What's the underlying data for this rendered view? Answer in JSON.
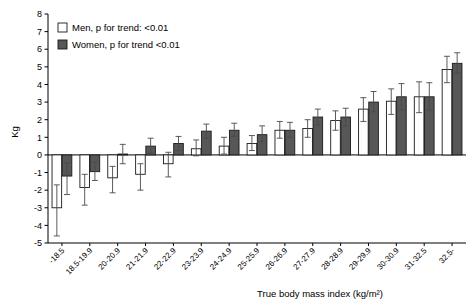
{
  "chart_data": {
    "type": "bar",
    "title": "",
    "xlabel": "True body mass index (kg/m²)",
    "ylabel": "Kg",
    "ylim": [
      -5,
      8
    ],
    "yticks": [
      -5,
      -4,
      -3,
      -2,
      -1,
      0,
      1,
      2,
      3,
      4,
      5,
      6,
      7,
      8
    ],
    "ytick_labels": [
      "-5",
      "-4",
      "-3",
      "-2",
      "-1",
      "0",
      "1",
      "2",
      "3",
      "4",
      "5",
      "6",
      "7",
      "8"
    ],
    "grid": false,
    "legend_position": "top-left",
    "categories": [
      "-18.5",
      "18.5-19.9",
      "20-20.9",
      "21-21.9",
      "22-22.9",
      "23-23.9",
      "24-24.9",
      "25-25.9",
      "26-26.9",
      "27-27.9",
      "28-28.9",
      "29-29.9",
      "30-30.9",
      "31-32.5",
      "32.5-"
    ],
    "series": [
      {
        "name": "Men, p for trend: <0.01",
        "color": "#ffffff",
        "edge_color": "#1a1a1a",
        "values": [
          -3.0,
          -1.85,
          -1.3,
          -1.1,
          -0.5,
          0.35,
          0.5,
          0.65,
          1.4,
          1.5,
          1.95,
          2.6,
          3.05,
          3.3,
          4.85
        ],
        "err_low": [
          -4.6,
          -2.85,
          -2.15,
          -2.0,
          -1.25,
          -0.05,
          0.05,
          0.25,
          0.95,
          1.0,
          1.4,
          1.9,
          2.3,
          2.4,
          4.1
        ],
        "err_high": [
          -1.7,
          -1.1,
          -0.65,
          -0.5,
          0.15,
          0.85,
          1.0,
          1.1,
          1.9,
          2.0,
          2.5,
          3.25,
          3.75,
          4.15,
          5.6
        ]
      },
      {
        "name": "Women, p for trend <0.01",
        "color": "#575757",
        "edge_color": "#1a1a1a",
        "values": [
          -1.2,
          -0.95,
          0.05,
          0.5,
          0.65,
          1.35,
          1.4,
          1.15,
          1.4,
          2.15,
          2.15,
          3.0,
          3.3,
          3.3,
          5.2
        ],
        "err_low": [
          -2.25,
          -1.45,
          -0.5,
          0.1,
          0.25,
          0.95,
          1.05,
          0.75,
          1.0,
          1.7,
          1.65,
          2.45,
          2.55,
          2.55,
          4.65
        ],
        "err_high": [
          -0.45,
          -0.4,
          0.6,
          0.95,
          1.05,
          1.75,
          1.8,
          1.65,
          1.85,
          2.6,
          2.65,
          3.6,
          4.05,
          4.1,
          5.8
        ]
      }
    ]
  },
  "legend": {
    "items": [
      {
        "label": "Men, p for trend: <0.01",
        "swatch": "men-swatch"
      },
      {
        "label": "Women, p for trend <0.01",
        "swatch": "women-swatch"
      }
    ]
  },
  "axes": {
    "y_label": "Kg",
    "x_label": "True body mass index (kg/m²)"
  }
}
